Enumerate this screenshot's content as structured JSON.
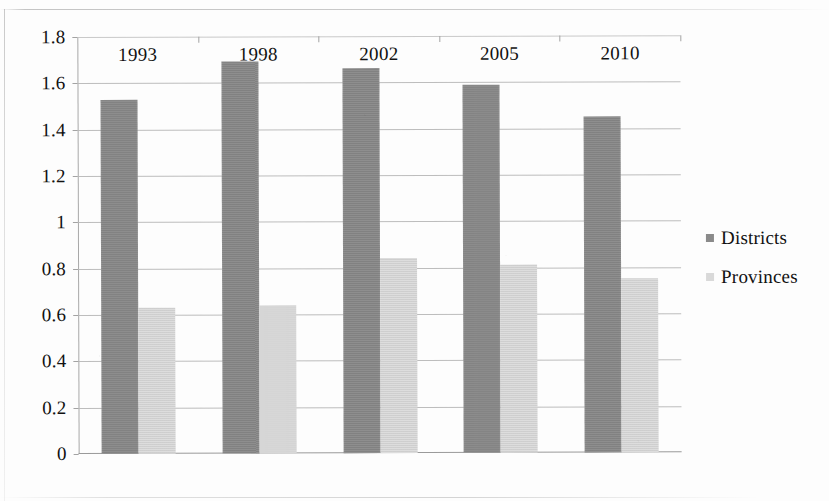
{
  "chart_data": {
    "type": "bar",
    "title": "",
    "subtitle": "",
    "xlabel": "",
    "ylabel": "",
    "categories": [
      "1993",
      "1998",
      "2002",
      "2005",
      "2010"
    ],
    "series": [
      {
        "name": "Districts",
        "color": "#888888",
        "values": [
          1.53,
          1.69,
          1.66,
          1.59,
          1.45
        ]
      },
      {
        "name": "Provinces",
        "color": "#d6d6d6",
        "values": [
          0.63,
          0.64,
          0.84,
          0.81,
          0.75
        ]
      }
    ],
    "ylim": [
      0,
      1.8
    ],
    "ytick_step": 0.2,
    "ytick_labels": [
      "0",
      "0.2",
      "0.4",
      "0.6",
      "0.8",
      "1",
      "1.2",
      "1.4",
      "1.6",
      "1.8"
    ],
    "grid": true,
    "grid_axis": "y",
    "legend_position": "right"
  },
  "legend": {
    "entries": [
      {
        "label": "Districts",
        "swatch": "legend-swatch-districts"
      },
      {
        "label": "Provinces",
        "swatch": "legend-swatch-provinces"
      }
    ]
  }
}
